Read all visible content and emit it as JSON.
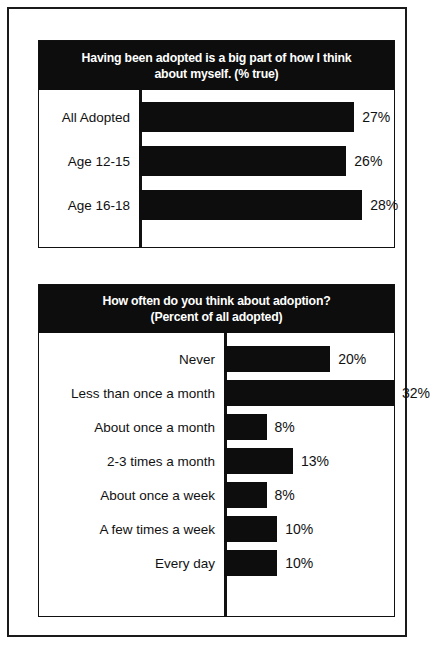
{
  "chart_data": [
    {
      "type": "bar",
      "orientation": "horizontal",
      "title": "Having been adopted is a big part of how I think about myself. (% true)",
      "title_lines": [
        "Having been adopted is a big part of how I think",
        "about myself. (% true)"
      ],
      "categories": [
        "All Adopted",
        "Age 12-15",
        "Age 16-18"
      ],
      "values": [
        27,
        26,
        28
      ],
      "value_labels": [
        "27%",
        "26%",
        "28%"
      ],
      "xlabel": "",
      "ylabel": "",
      "xlim": [
        0,
        32
      ],
      "grid": false,
      "legend": null,
      "bar_color": "#0d0d0d",
      "title_bg": "#0d0d0d",
      "title_color": "#ffffff"
    },
    {
      "type": "bar",
      "orientation": "horizontal",
      "title": "How often do you think about adoption? (Percent of all adopted)",
      "title_lines": [
        "How often do you think about adoption?",
        "(Percent of all adopted)"
      ],
      "categories": [
        "Never",
        "Less than once a month",
        "About once a month",
        "2-3 times a month",
        "About once a week",
        "A few times a week",
        "Every day"
      ],
      "values": [
        20,
        32,
        8,
        13,
        8,
        10,
        10
      ],
      "value_labels": [
        "20%",
        "32%",
        "8%",
        "13%",
        "8%",
        "10%",
        "10%"
      ],
      "xlabel": "",
      "ylabel": "",
      "xlim": [
        0,
        32
      ],
      "grid": false,
      "legend": null,
      "bar_color": "#0d0d0d",
      "title_bg": "#0d0d0d",
      "title_color": "#ffffff"
    }
  ],
  "charts": [
    {
      "title_line_1": "Having been adopted is a big part of how I think",
      "title_line_2": "about myself. (% true)",
      "rows": [
        {
          "label": "All Adopted",
          "value": "27%",
          "width_pct": 84.4
        },
        {
          "label": "Age 12-15",
          "value": "26%",
          "width_pct": 81.3
        },
        {
          "label": "Age 16-18",
          "value": "28%",
          "width_pct": 87.5
        }
      ]
    },
    {
      "title_line_1": "How often do you think about adoption?",
      "title_line_2": "(Percent of all adopted)",
      "rows": [
        {
          "label": "Never",
          "value": "20%",
          "width_pct": 62.5
        },
        {
          "label": "Less than once a month",
          "value": "32%",
          "width_pct": 100.0
        },
        {
          "label": "About once a month",
          "value": "8%",
          "width_pct": 25.0
        },
        {
          "label": "2-3 times a month",
          "value": "13%",
          "width_pct": 40.6
        },
        {
          "label": "About once a week",
          "value": "8%",
          "width_pct": 25.0
        },
        {
          "label": "A few times a week",
          "value": "10%",
          "width_pct": 31.3
        },
        {
          "label": "Every day",
          "value": "10%",
          "width_pct": 31.3
        }
      ]
    }
  ]
}
